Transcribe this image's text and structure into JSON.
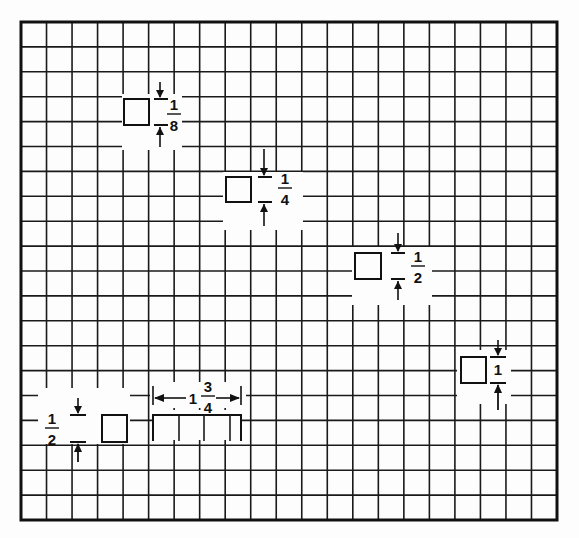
{
  "figure": {
    "grid": {
      "x0": 21,
      "y0": 22,
      "x1": 557,
      "y1": 520,
      "cols": 21,
      "rows": 20,
      "line_color": "#1a1a1a"
    },
    "squares": [
      {
        "id": "eighth",
        "label_num": "1",
        "label_den": "8"
      },
      {
        "id": "quarter",
        "label_num": "1",
        "label_den": "4"
      },
      {
        "id": "half",
        "label_num": "1",
        "label_den": "2"
      },
      {
        "id": "one",
        "label_whole": "1"
      },
      {
        "id": "half-left",
        "label_num": "1",
        "label_den": "2"
      }
    ],
    "rectangle": {
      "label_whole": "1",
      "label_num": "3",
      "label_den": "4"
    }
  }
}
